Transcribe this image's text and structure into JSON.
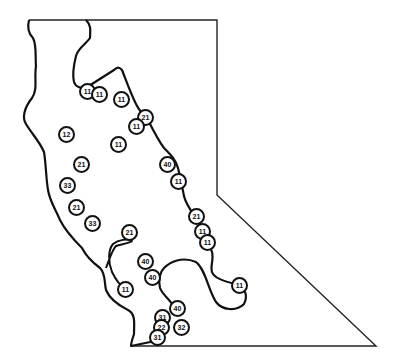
{
  "map": {
    "colors": {
      "line": "#111111",
      "background": "#ffffff"
    },
    "markers": [
      {
        "label": "11",
        "x": 88,
        "y": 92
      },
      {
        "label": "11",
        "x": 100,
        "y": 95
      },
      {
        "label": "11",
        "x": 122,
        "y": 100
      },
      {
        "label": "21",
        "x": 146,
        "y": 118
      },
      {
        "label": "11",
        "x": 137,
        "y": 127
      },
      {
        "label": "12",
        "x": 67,
        "y": 135
      },
      {
        "label": "11",
        "x": 119,
        "y": 145
      },
      {
        "label": "40",
        "x": 168,
        "y": 165
      },
      {
        "label": "11",
        "x": 179,
        "y": 182
      },
      {
        "label": "21",
        "x": 82,
        "y": 165
      },
      {
        "label": "33",
        "x": 68,
        "y": 186
      },
      {
        "label": "21",
        "x": 77,
        "y": 208
      },
      {
        "label": "33",
        "x": 93,
        "y": 224
      },
      {
        "label": "21",
        "x": 197,
        "y": 217
      },
      {
        "label": "11",
        "x": 203,
        "y": 232
      },
      {
        "label": "11",
        "x": 208,
        "y": 243
      },
      {
        "label": "21",
        "x": 130,
        "y": 233
      },
      {
        "label": "40",
        "x": 146,
        "y": 262
      },
      {
        "label": "40",
        "x": 153,
        "y": 278
      },
      {
        "label": "11",
        "x": 126,
        "y": 290
      },
      {
        "label": "11",
        "x": 240,
        "y": 286
      },
      {
        "label": "40",
        "x": 178,
        "y": 309
      },
      {
        "label": "31",
        "x": 163,
        "y": 318
      },
      {
        "label": "22",
        "x": 162,
        "y": 328
      },
      {
        "label": "32",
        "x": 182,
        "y": 328
      },
      {
        "label": "31",
        "x": 158,
        "y": 338
      }
    ]
  }
}
